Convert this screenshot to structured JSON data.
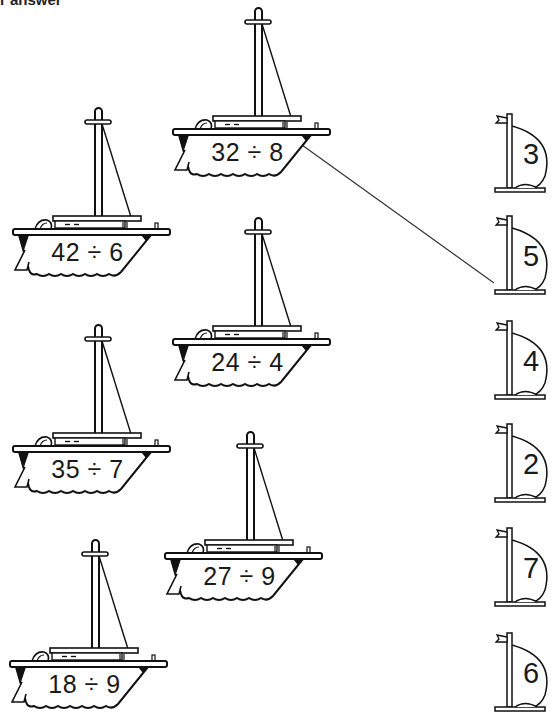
{
  "header": {
    "partial_instruction": "r answer"
  },
  "problems": [
    {
      "id": "p1",
      "expression": "32 ÷ 8",
      "left": 165,
      "top": 0
    },
    {
      "id": "p2",
      "expression": "42 ÷ 6",
      "left": 5,
      "top": 100
    },
    {
      "id": "p3",
      "expression": "24 ÷ 4",
      "left": 165,
      "top": 210
    },
    {
      "id": "p4",
      "expression": "35 ÷ 7",
      "left": 5,
      "top": 317
    },
    {
      "id": "p5",
      "expression": "27 ÷ 9",
      "left": 157,
      "top": 424
    },
    {
      "id": "p6",
      "expression": "18 ÷ 9",
      "left": 2,
      "top": 532
    }
  ],
  "answers": [
    {
      "id": "a1",
      "value": "3",
      "top": 108
    },
    {
      "id": "a2",
      "value": "5",
      "top": 210
    },
    {
      "id": "a3",
      "value": "4",
      "top": 315
    },
    {
      "id": "a4",
      "value": "2",
      "top": 418
    },
    {
      "id": "a5",
      "value": "7",
      "top": 522
    },
    {
      "id": "a6",
      "value": "6",
      "top": 627
    }
  ],
  "connections": [
    {
      "from": "32 ÷ 8",
      "to": "4",
      "x1": 302,
      "y1": 145,
      "x2": 494,
      "y2": 283
    }
  ],
  "colors": {
    "ink": "#1a1a1a",
    "paper": "#ffffff"
  }
}
